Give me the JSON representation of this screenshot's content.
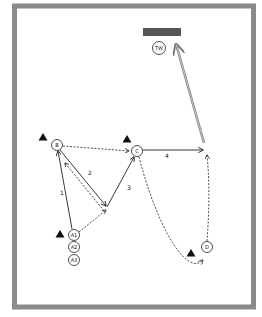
{
  "colors": {
    "frame": "#8a8a8a",
    "goal": "#555555",
    "line": "#222222",
    "shot": "#7a7a7a",
    "cone": "#111111",
    "background": "#ffffff"
  },
  "goal": {
    "label": "goal"
  },
  "players": [
    {
      "id": "TW",
      "label": "TW",
      "x": 159,
      "y": 48
    },
    {
      "id": "B",
      "label": "B",
      "x": 57,
      "y": 145
    },
    {
      "id": "C",
      "label": "C",
      "x": 137,
      "y": 151
    },
    {
      "id": "A1",
      "label": "A1",
      "x": 74,
      "y": 235
    },
    {
      "id": "A2",
      "label": "A2",
      "x": 74,
      "y": 247
    },
    {
      "id": "A3",
      "label": "A3",
      "x": 74,
      "y": 260
    },
    {
      "id": "D",
      "label": "D",
      "x": 207,
      "y": 247
    }
  ],
  "cones": [
    {
      "x": 43,
      "y": 137
    },
    {
      "x": 127,
      "y": 139
    },
    {
      "x": 60,
      "y": 234
    },
    {
      "x": 191,
      "y": 253
    }
  ],
  "step_labels": [
    {
      "text": "1",
      "x": 60,
      "y": 195
    },
    {
      "text": "2",
      "x": 88,
      "y": 175
    },
    {
      "text": "3",
      "x": 127,
      "y": 190
    },
    {
      "text": "4",
      "x": 165,
      "y": 158
    }
  ]
}
